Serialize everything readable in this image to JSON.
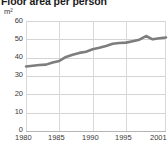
{
  "chart_data": {
    "type": "line",
    "title": "Floor area per person",
    "subtitle": "",
    "xlabel": "",
    "ylabel": "",
    "unit_label": "m²",
    "xlim": [
      1980,
      2001
    ],
    "ylim": [
      0,
      60
    ],
    "grid": "horizontal",
    "legend": "none",
    "series_color": "#7d7d7d",
    "grid_color": "#d4d4d4",
    "axis_color": "#9a9a9a",
    "text_color": "#3a3a3a",
    "title_color": "#1a1a1a",
    "background": "#ffffff",
    "y_ticks": [
      60,
      50,
      40,
      30,
      20,
      10,
      0
    ],
    "x_ticks": [
      1980,
      1985,
      1990,
      1995,
      2001
    ],
    "x": [
      1980,
      1981,
      1982,
      1983,
      1984,
      1985,
      1986,
      1987,
      1988,
      1989,
      1990,
      1991,
      1992,
      1993,
      1994,
      1995,
      1996,
      1997,
      1998,
      1999,
      2000,
      2001
    ],
    "series": [
      {
        "name": "Floor area per person",
        "values": [
          35.2,
          35.6,
          36.0,
          36.2,
          37.4,
          38.2,
          40.4,
          41.6,
          42.6,
          43.2,
          44.6,
          45.4,
          46.4,
          47.6,
          48.0,
          48.2,
          49.0,
          49.8,
          51.8,
          50.0,
          50.6,
          51.0
        ]
      }
    ]
  }
}
